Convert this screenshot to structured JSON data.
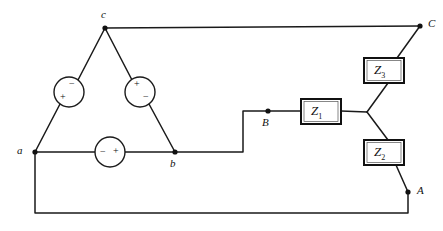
{
  "figure": {
    "type": "electrical-circuit-schematic",
    "width": 443,
    "height": 231,
    "background_color": "#ffffff",
    "line_color": "#1a1a1a"
  },
  "nodes": [
    {
      "id": "a",
      "label": "a",
      "x": 35,
      "y": 152,
      "label_x": 17,
      "label_y": 145
    },
    {
      "id": "b",
      "label": "b",
      "x": 175,
      "y": 152,
      "label_x": 170,
      "label_y": 158
    },
    {
      "id": "c",
      "label": "c",
      "x": 105,
      "y": 28,
      "label_x": 101,
      "label_y": 10
    },
    {
      "id": "junction",
      "label": "",
      "x": 367,
      "y": 112,
      "label_x": 0,
      "label_y": 0
    }
  ],
  "terminals": [
    {
      "id": "A",
      "label": "A",
      "x": 408,
      "y": 192,
      "label_x": 417,
      "label_y": 185
    },
    {
      "id": "B",
      "label": "B",
      "x": 268,
      "y": 111,
      "label_x": 263,
      "label_y": 118
    },
    {
      "id": "C",
      "label": "C",
      "x": 420,
      "y": 26,
      "label_x": 428,
      "label_y": 19
    }
  ],
  "sources": [
    {
      "id": "source-ca",
      "name": "source-circle-left",
      "cx": 69,
      "cy": 92,
      "r": 15,
      "signs": [
        {
          "text": "−",
          "x": 70,
          "y": 81
        },
        {
          "text": "+",
          "x": 61,
          "y": 95
        }
      ]
    },
    {
      "id": "source-cb",
      "name": "source-circle-right",
      "cx": 140,
      "cy": 92,
      "r": 15,
      "signs": [
        {
          "text": "+",
          "x": 135,
          "y": 81
        },
        {
          "text": "−",
          "x": 144,
          "y": 95
        }
      ]
    },
    {
      "id": "source-ab",
      "name": "source-circle-bottom",
      "cx": 110,
      "cy": 152,
      "r": 15,
      "signs": [
        {
          "text": "−",
          "x": 100,
          "y": 147
        },
        {
          "text": "+",
          "x": 113,
          "y": 146
        }
      ]
    }
  ],
  "impedances": [
    {
      "id": "Z1",
      "label": "Z",
      "subscript": "1",
      "x": 301,
      "y": 99,
      "w": 40,
      "h": 25,
      "label_x": 310,
      "label_y": 105
    },
    {
      "id": "Z2",
      "label": "Z",
      "subscript": "2",
      "x": 364,
      "y": 140,
      "w": 40,
      "h": 25,
      "label_x": 373,
      "label_y": 146
    },
    {
      "id": "Z3",
      "label": "Z",
      "subscript": "3",
      "x": 364,
      "y": 58,
      "w": 40,
      "h": 25,
      "label_x": 373,
      "label_y": 64
    }
  ],
  "wires": [
    {
      "name": "wire-c-to-left-source",
      "d": "M 105 28 L 78 80"
    },
    {
      "name": "wire-left-source-to-a",
      "d": "M 60 104 L 35 152"
    },
    {
      "name": "wire-c-to-right-source",
      "d": "M 105 28 L 132 80"
    },
    {
      "name": "wire-right-source-to-b",
      "d": "M 149 104 L 175 152"
    },
    {
      "name": "wire-a-to-bottom-source",
      "d": "M 35 152 L 95 152"
    },
    {
      "name": "wire-bottom-source-to-b",
      "d": "M 125 152 L 175 152"
    },
    {
      "name": "wire-c-to-C",
      "d": "M 105 28 L 420 26"
    },
    {
      "name": "wire-C-to-Z3",
      "d": "M 420 26 L 397 58"
    },
    {
      "name": "wire-b-to-B-step",
      "d": "M 175 152 L 243 152 L 243 111 L 268 111"
    },
    {
      "name": "wire-B-to-Z1",
      "d": "M 268 111 L 301 111"
    },
    {
      "name": "wire-Z1-to-junction",
      "d": "M 341 111 L 367 112"
    },
    {
      "name": "wire-junction-to-Z3",
      "d": "M 367 112 L 388 83"
    },
    {
      "name": "wire-junction-to-Z2",
      "d": "M 367 112 L 388 140"
    },
    {
      "name": "wire-Z2-to-A",
      "d": "M 396 165 L 408 192"
    },
    {
      "name": "wire-a-to-A-return",
      "d": "M 35 152 L 35 213 L 408 213 L 408 192"
    }
  ]
}
